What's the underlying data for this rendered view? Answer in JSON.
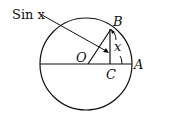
{
  "diagram": {
    "title_label": "Sin x",
    "points": {
      "O": "O",
      "A": "A",
      "B": "B",
      "C": "C"
    },
    "angle_label": "x",
    "line_color": "#111111"
  }
}
